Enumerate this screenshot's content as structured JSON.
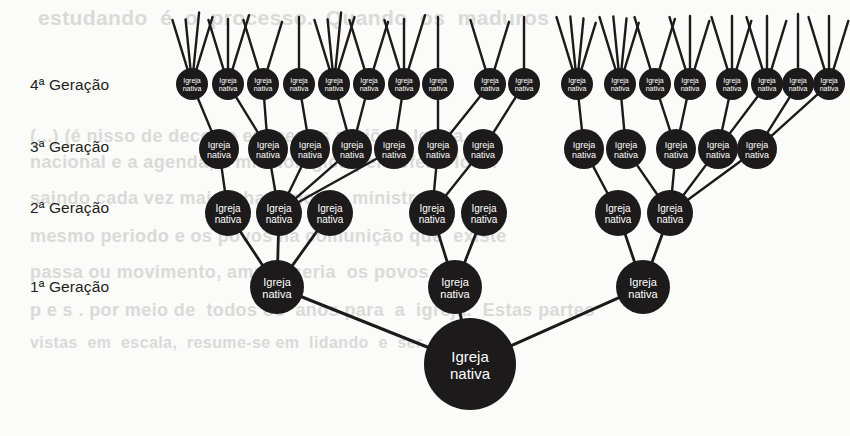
{
  "figure": {
    "node_label_line1": "Igreja",
    "node_label_line2": "nativa",
    "node_label_full": "Igreja nativa",
    "node_color": "#1c1a1a",
    "node_text_color": "#ffffff",
    "edge_color": "#1c1a1a",
    "background_color": "#fbfbfa"
  },
  "generation_labels": [
    {
      "id": "gen4",
      "text": "4ª Geração",
      "x": 30,
      "y": 76
    },
    {
      "id": "gen3",
      "text": "3ª Geração",
      "x": 30,
      "y": 138
    },
    {
      "id": "gen2",
      "text": "2ª Geração",
      "x": 30,
      "y": 199
    },
    {
      "id": "gen1",
      "text": "1ª Geração",
      "x": 30,
      "y": 278
    }
  ],
  "chart_data": {
    "type": "diagram",
    "title": "",
    "levels": [
      {
        "name": "root",
        "label": "1ª Geração (origem)",
        "count": 1,
        "y": 364,
        "radius": 46
      },
      {
        "name": "gen1",
        "label": "1ª Geração",
        "count": 3,
        "y": 287,
        "radius": 27
      },
      {
        "name": "gen2",
        "label": "2ª Geração",
        "count": 7,
        "y": 213,
        "radius": 23
      },
      {
        "name": "gen3",
        "label": "3ª Geração",
        "count": 12,
        "y": 149,
        "radius": 20
      },
      {
        "name": "gen4",
        "label": "4ª Geração",
        "count": 18,
        "y": 84,
        "radius": 16
      }
    ],
    "nodes": {
      "root": [
        {
          "id": "r0",
          "x": 470,
          "y": 364,
          "r": 46,
          "fs": 15
        }
      ],
      "gen1": [
        {
          "id": "g1_0",
          "x": 277,
          "y": 287,
          "r": 27,
          "fs": 11
        },
        {
          "id": "g1_1",
          "x": 455,
          "y": 287,
          "r": 27,
          "fs": 11
        },
        {
          "id": "g1_2",
          "x": 643,
          "y": 287,
          "r": 27,
          "fs": 11
        }
      ],
      "gen2": [
        {
          "id": "g2_0",
          "x": 228,
          "y": 213,
          "r": 23,
          "fs": 10
        },
        {
          "id": "g2_1",
          "x": 279,
          "y": 213,
          "r": 23,
          "fs": 10
        },
        {
          "id": "g2_2",
          "x": 330,
          "y": 213,
          "r": 23,
          "fs": 10
        },
        {
          "id": "g2_3",
          "x": 432,
          "y": 213,
          "r": 23,
          "fs": 10
        },
        {
          "id": "g2_4",
          "x": 484,
          "y": 213,
          "r": 23,
          "fs": 10
        },
        {
          "id": "g2_5",
          "x": 618,
          "y": 213,
          "r": 23,
          "fs": 10
        },
        {
          "id": "g2_6",
          "x": 670,
          "y": 213,
          "r": 23,
          "fs": 10
        }
      ],
      "gen3": [
        {
          "id": "g3_0",
          "x": 219,
          "y": 149,
          "r": 20,
          "fs": 9
        },
        {
          "id": "g3_1",
          "x": 268,
          "y": 149,
          "r": 20,
          "fs": 9
        },
        {
          "id": "g3_2",
          "x": 310,
          "y": 149,
          "r": 20,
          "fs": 9
        },
        {
          "id": "g3_3",
          "x": 352,
          "y": 149,
          "r": 20,
          "fs": 9
        },
        {
          "id": "g3_4",
          "x": 394,
          "y": 149,
          "r": 20,
          "fs": 9
        },
        {
          "id": "g3_5",
          "x": 438,
          "y": 149,
          "r": 20,
          "fs": 9
        },
        {
          "id": "g3_6",
          "x": 483,
          "y": 149,
          "r": 20,
          "fs": 9
        },
        {
          "id": "g3_7",
          "x": 584,
          "y": 149,
          "r": 20,
          "fs": 9
        },
        {
          "id": "g3_8",
          "x": 626,
          "y": 149,
          "r": 20,
          "fs": 9
        },
        {
          "id": "g3_9",
          "x": 676,
          "y": 149,
          "r": 20,
          "fs": 9
        },
        {
          "id": "g3_10",
          "x": 718,
          "y": 149,
          "r": 20,
          "fs": 9
        },
        {
          "id": "g3_11",
          "x": 757,
          "y": 149,
          "r": 20,
          "fs": 9
        }
      ],
      "gen4": [
        {
          "id": "g4_0",
          "x": 192,
          "y": 84,
          "r": 16,
          "fs": 7
        },
        {
          "id": "g4_1",
          "x": 228,
          "y": 84,
          "r": 16,
          "fs": 7
        },
        {
          "id": "g4_2",
          "x": 263,
          "y": 84,
          "r": 16,
          "fs": 7
        },
        {
          "id": "g4_3",
          "x": 299,
          "y": 84,
          "r": 16,
          "fs": 7
        },
        {
          "id": "g4_4",
          "x": 334,
          "y": 84,
          "r": 16,
          "fs": 7
        },
        {
          "id": "g4_5",
          "x": 369,
          "y": 84,
          "r": 16,
          "fs": 7
        },
        {
          "id": "g4_6",
          "x": 404,
          "y": 84,
          "r": 16,
          "fs": 7
        },
        {
          "id": "g4_7",
          "x": 438,
          "y": 84,
          "r": 16,
          "fs": 7
        },
        {
          "id": "g4_8",
          "x": 490,
          "y": 84,
          "r": 16,
          "fs": 7
        },
        {
          "id": "g4_9",
          "x": 524,
          "y": 84,
          "r": 16,
          "fs": 7
        },
        {
          "id": "g4_10",
          "x": 577,
          "y": 84,
          "r": 16,
          "fs": 7
        },
        {
          "id": "g4_11",
          "x": 620,
          "y": 84,
          "r": 16,
          "fs": 7
        },
        {
          "id": "g4_12",
          "x": 655,
          "y": 84,
          "r": 16,
          "fs": 7
        },
        {
          "id": "g4_13",
          "x": 690,
          "y": 84,
          "r": 16,
          "fs": 7
        },
        {
          "id": "g4_14",
          "x": 732,
          "y": 84,
          "r": 16,
          "fs": 7
        },
        {
          "id": "g4_15",
          "x": 767,
          "y": 84,
          "r": 16,
          "fs": 7
        },
        {
          "id": "g4_16",
          "x": 798,
          "y": 84,
          "r": 16,
          "fs": 7
        },
        {
          "id": "g4_17",
          "x": 829,
          "y": 84,
          "r": 16,
          "fs": 7
        }
      ]
    },
    "edges": [
      [
        "g1_0",
        "r0"
      ],
      [
        "g1_1",
        "r0"
      ],
      [
        "g1_2",
        "r0"
      ],
      [
        "g2_0",
        "g1_0"
      ],
      [
        "g2_1",
        "g1_0"
      ],
      [
        "g2_2",
        "g1_0"
      ],
      [
        "g2_3",
        "g1_1"
      ],
      [
        "g2_4",
        "g1_1"
      ],
      [
        "g2_5",
        "g1_2"
      ],
      [
        "g2_6",
        "g1_2"
      ],
      [
        "g3_0",
        "g2_0"
      ],
      [
        "g3_1",
        "g2_1"
      ],
      [
        "g3_2",
        "g2_1"
      ],
      [
        "g3_3",
        "g2_1"
      ],
      [
        "g3_4",
        "g2_1"
      ],
      [
        "g3_5",
        "g2_3"
      ],
      [
        "g3_6",
        "g2_3"
      ],
      [
        "g3_7",
        "g2_5"
      ],
      [
        "g3_8",
        "g2_6"
      ],
      [
        "g3_9",
        "g2_6"
      ],
      [
        "g3_10",
        "g2_6"
      ],
      [
        "g3_11",
        "g2_6"
      ],
      [
        "g4_0",
        "g3_0"
      ],
      [
        "g4_1",
        "g3_1"
      ],
      [
        "g4_2",
        "g3_1"
      ],
      [
        "g4_3",
        "g3_2"
      ],
      [
        "g4_4",
        "g3_3"
      ],
      [
        "g4_5",
        "g3_3"
      ],
      [
        "g4_6",
        "g3_4"
      ],
      [
        "g4_7",
        "g3_5"
      ],
      [
        "g4_8",
        "g3_5"
      ],
      [
        "g4_9",
        "g3_6"
      ],
      [
        "g4_10",
        "g3_7"
      ],
      [
        "g4_11",
        "g3_8"
      ],
      [
        "g4_12",
        "g3_9"
      ],
      [
        "g4_13",
        "g3_9"
      ],
      [
        "g4_14",
        "g3_10"
      ],
      [
        "g4_15",
        "g3_10"
      ],
      [
        "g4_16",
        "g3_11"
      ],
      [
        "g4_17",
        "g3_11"
      ]
    ],
    "sprouts": [
      {
        "node": "g4_0",
        "count": 4
      },
      {
        "node": "g4_1",
        "count": 3
      },
      {
        "node": "g4_2",
        "count": 2
      },
      {
        "node": "g4_3",
        "count": 1
      },
      {
        "node": "g4_4",
        "count": 4
      },
      {
        "node": "g4_5",
        "count": 2
      },
      {
        "node": "g4_6",
        "count": 3
      },
      {
        "node": "g4_7",
        "count": 1
      },
      {
        "node": "g4_8",
        "count": 2
      },
      {
        "node": "g4_9",
        "count": 1
      },
      {
        "node": "g4_10",
        "count": 4
      },
      {
        "node": "g4_11",
        "count": 4
      },
      {
        "node": "g4_12",
        "count": 2
      },
      {
        "node": "g4_13",
        "count": 3
      },
      {
        "node": "g4_14",
        "count": 3
      },
      {
        "node": "g4_15",
        "count": 3
      },
      {
        "node": "g4_16",
        "count": 1
      },
      {
        "node": "g4_17",
        "count": 3
      }
    ]
  },
  "background_bleed": [
    {
      "text": "estudando  é  o  processo.  Quando  os  maduros",
      "x": 38,
      "y": 6,
      "size": 21
    },
    {
      "text": "(...) (é nisso de decorre em certas regiões. Igreja",
      "x": 30,
      "y": 126,
      "size": 18
    },
    {
      "text": "nacional e a agenda, a missiológica pelo efeito local",
      "x": 30,
      "y": 152,
      "size": 18
    },
    {
      "text": "saindo cada vez mais, chamado em ministra o",
      "x": 30,
      "y": 188,
      "size": 18
    },
    {
      "text": "mesmo periodo e os povos na comunição que  existe",
      "x": 30,
      "y": 226,
      "size": 18
    },
    {
      "text": "passa ou movimento, ampla  seria  os povos",
      "x": 30,
      "y": 262,
      "size": 18
    },
    {
      "text": "p e s . por meio de  todos os  anos para  a  igreja.  Estas partes",
      "x": 30,
      "y": 300,
      "size": 18
    },
    {
      "text": "vistas  em  escala,  resume-se em  lidando  e  ser  concluir",
      "x": 30,
      "y": 334,
      "size": 16
    }
  ]
}
